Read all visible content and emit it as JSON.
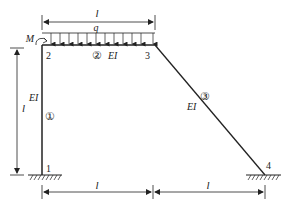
{
  "diagram": {
    "type": "structural-frame",
    "load": {
      "symbol": "q",
      "type": "uniformly-distributed",
      "direction": "down",
      "span": "member 2"
    },
    "moment": {
      "symbol": "M",
      "node": "2"
    },
    "nodes": [
      {
        "id": "1",
        "label": "1",
        "support": "fixed"
      },
      {
        "id": "2",
        "label": "2"
      },
      {
        "id": "3",
        "label": "3"
      },
      {
        "id": "4",
        "label": "4",
        "support": "fixed"
      }
    ],
    "members": [
      {
        "id": "1",
        "label": "①",
        "from": "1",
        "to": "2",
        "stiffness": "EI"
      },
      {
        "id": "2",
        "label": "②",
        "from": "2",
        "to": "3",
        "stiffness": "EI"
      },
      {
        "id": "3",
        "label": "③",
        "from": "3",
        "to": "4",
        "stiffness": "EI"
      }
    ],
    "dimensions": {
      "top": "l",
      "left": "l",
      "bottom_left": "l",
      "bottom_right": "l"
    }
  }
}
